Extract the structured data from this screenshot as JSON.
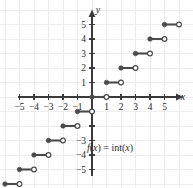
{
  "figure": {
    "width": 193,
    "height": 188,
    "background_color": "#ffffff"
  },
  "axes": {
    "x_axis_name": "x",
    "y_axis_name": "y",
    "origin_px": {
      "x": 92,
      "y": 97
    },
    "unit_px": 14.5,
    "x_tick_labels": [
      "-5",
      "-4",
      "-3",
      "-2",
      "-1",
      "1",
      "2",
      "3",
      "4",
      "5"
    ],
    "x_tick_values": [
      -5,
      -4,
      -3,
      -2,
      -1,
      1,
      2,
      3,
      4,
      5
    ],
    "y_tick_labels": [
      "5",
      "4",
      "3",
      "2",
      "1",
      "-3",
      "-4",
      "-5"
    ],
    "y_tick_values": [
      5,
      4,
      3,
      2,
      1,
      -3,
      -4,
      -5
    ],
    "axis_color": "#3a3a3a",
    "grid_color": "#ededf0"
  },
  "annotation": {
    "function_label_f": "f",
    "function_label_paren_open": "(",
    "function_label_var": "x",
    "function_label_paren_close": ")",
    "function_label_eq": " = int(",
    "function_label_var2": "x",
    "function_label_end": ")",
    "function_label_full": "f(x) = int(x)"
  },
  "chart_data": {
    "type": "line",
    "title": "",
    "xlabel": "x",
    "ylabel": "y",
    "xlim": [
      -6.6,
      5.9
    ],
    "ylim": [
      -6.4,
      5.7
    ],
    "grid": true,
    "legend": null,
    "annotations": [
      "f(x) = int(x)"
    ],
    "segment_color": "#4a4a4a",
    "steps": [
      {
        "y": 5,
        "x_start": 5,
        "x_end": 6,
        "left_endpoint": "closed",
        "right_endpoint": "open"
      },
      {
        "y": 4,
        "x_start": 4,
        "x_end": 5,
        "left_endpoint": "closed",
        "right_endpoint": "open"
      },
      {
        "y": 3,
        "x_start": 3,
        "x_end": 4,
        "left_endpoint": "closed",
        "right_endpoint": "open"
      },
      {
        "y": 2,
        "x_start": 2,
        "x_end": 3,
        "left_endpoint": "closed",
        "right_endpoint": "open"
      },
      {
        "y": 1,
        "x_start": 1,
        "x_end": 2,
        "left_endpoint": "closed",
        "right_endpoint": "open"
      },
      {
        "y": 0,
        "x_start": 0,
        "x_end": 1,
        "left_endpoint": "closed",
        "right_endpoint": "open"
      },
      {
        "y": -1,
        "x_start": -1,
        "x_end": 0,
        "left_endpoint": "closed",
        "right_endpoint": "open"
      },
      {
        "y": -2,
        "x_start": -2,
        "x_end": -1,
        "left_endpoint": "closed",
        "right_endpoint": "open"
      },
      {
        "y": -3,
        "x_start": -3,
        "x_end": -2,
        "left_endpoint": "closed",
        "right_endpoint": "open"
      },
      {
        "y": -4,
        "x_start": -4,
        "x_end": -3,
        "left_endpoint": "closed",
        "right_endpoint": "open"
      },
      {
        "y": -5,
        "x_start": -5,
        "x_end": -4,
        "left_endpoint": "closed",
        "right_endpoint": "open"
      },
      {
        "y": -6,
        "x_start": -6,
        "x_end": -5,
        "left_endpoint": "closed",
        "right_endpoint": "open"
      }
    ]
  }
}
